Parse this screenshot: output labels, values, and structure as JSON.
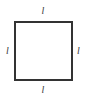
{
  "figure": {
    "name": "square-with-equal-side-labels",
    "shape": "square",
    "background_color": "#ffffff",
    "stroke_color": "#333333",
    "stroke_width_px": 2,
    "label_color": "#3a3a3a",
    "labels": {
      "top": "l",
      "right": "l",
      "bottom": "l",
      "left": "l"
    }
  },
  "chart_data": {
    "type": "diagram",
    "title": "",
    "shape": "square",
    "vertices": [
      {
        "name": "top-left",
        "x": 14,
        "y": 21
      },
      {
        "name": "top-right",
        "x": 73,
        "y": 21
      },
      {
        "name": "bottom-right",
        "x": 73,
        "y": 81
      },
      {
        "name": "bottom-left",
        "x": 14,
        "y": 81
      }
    ],
    "edges": [
      {
        "name": "top",
        "label": "l",
        "length_px": 59
      },
      {
        "name": "right",
        "label": "l",
        "length_px": 60
      },
      {
        "name": "bottom",
        "label": "l",
        "length_px": 59
      },
      {
        "name": "left",
        "label": "l",
        "length_px": 60
      }
    ],
    "annotations": [
      "l",
      "l",
      "l",
      "l"
    ]
  }
}
